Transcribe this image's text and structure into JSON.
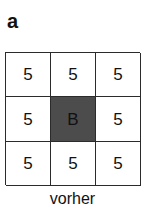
{
  "panel": {
    "label": "a",
    "caption": "vorher"
  },
  "colors": {
    "grid_line": "#2b2b2b",
    "cell_background": "#ffffff",
    "shaded_cell_background": "#4c4c4c",
    "text": "#111111"
  },
  "grid": {
    "rows": 3,
    "cols": 3,
    "cells": [
      {
        "value": "5",
        "shaded": false
      },
      {
        "value": "5",
        "shaded": false
      },
      {
        "value": "5",
        "shaded": false
      },
      {
        "value": "5",
        "shaded": false
      },
      {
        "value": "B",
        "shaded": true
      },
      {
        "value": "5",
        "shaded": false
      },
      {
        "value": "5",
        "shaded": false
      },
      {
        "value": "5",
        "shaded": false
      },
      {
        "value": "5",
        "shaded": false
      }
    ]
  }
}
